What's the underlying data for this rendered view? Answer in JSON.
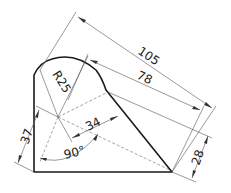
{
  "drawing": {
    "type": "technical drawing",
    "colors": {
      "outline": "#1a1a1a",
      "dimension": "#555555",
      "text": "#222222"
    },
    "dimensions": {
      "overall_length": "105",
      "inner_length": "78",
      "right_offset": "28",
      "left_offset": "37",
      "center_offset": "34",
      "radius": "R25",
      "angle": "90°"
    }
  }
}
